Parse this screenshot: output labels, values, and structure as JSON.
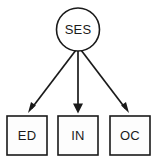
{
  "diagram": {
    "type": "path-diagram",
    "background_color": "#ffffff",
    "stroke_color": "#1a1a1a",
    "text_color": "#1a1a1a",
    "latent": {
      "id": "ses",
      "label": "SES",
      "shape": "circle",
      "center_x": 78,
      "center_y": 29.5,
      "radius": 21.5,
      "fill": "#ffffff"
    },
    "observed": [
      {
        "id": "ed",
        "label": "ED",
        "shape": "rect",
        "x": 7,
        "y": 116,
        "width": 40,
        "height": 39,
        "fill": "#fdfdfd"
      },
      {
        "id": "in",
        "label": "IN",
        "shape": "rect",
        "x": 58,
        "y": 116,
        "width": 40,
        "height": 39,
        "fill": "#fdfdfd"
      },
      {
        "id": "oc",
        "label": "OC",
        "shape": "rect",
        "x": 110,
        "y": 116,
        "width": 40,
        "height": 39,
        "fill": "#fdfdfd"
      }
    ],
    "paths": [
      {
        "id": "ses-to-ed",
        "from": "ses",
        "to": "ed",
        "direction": "one-way",
        "x1": 76,
        "y1": 50,
        "x2": 28,
        "y2": 113
      },
      {
        "id": "ses-to-in",
        "from": "ses",
        "to": "in",
        "direction": "one-way",
        "x1": 78,
        "y1": 51,
        "x2": 78,
        "y2": 113
      },
      {
        "id": "ses-to-oc",
        "from": "ses",
        "to": "oc",
        "direction": "one-way",
        "x1": 81,
        "y1": 50,
        "x2": 129,
        "y2": 113
      }
    ]
  }
}
